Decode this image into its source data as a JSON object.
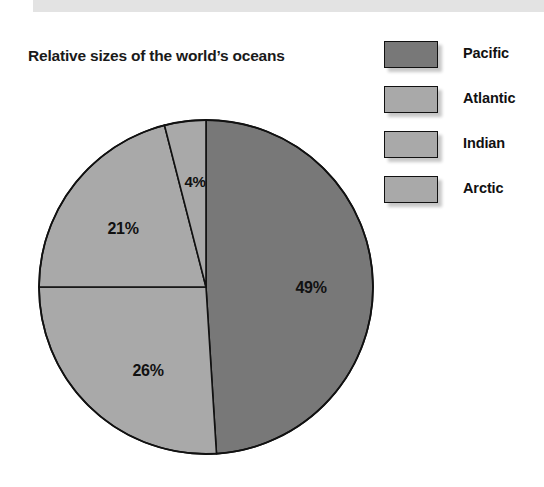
{
  "page": {
    "background_color": "#ffffff",
    "top_band_color": "#e3e3e3"
  },
  "title": "Relative sizes of the world’s oceans",
  "legend": {
    "position": "top-right",
    "items": [
      {
        "label": "Pacific",
        "color": "#787878"
      },
      {
        "label": "Atlantic",
        "color": "#a9a9a9"
      },
      {
        "label": "Indian",
        "color": "#a9a9a9"
      },
      {
        "label": "Arctic",
        "color": "#a9a9a9"
      }
    ]
  },
  "labels": {
    "pacific": "49%",
    "atlantic": "26%",
    "indian": "21%",
    "arctic": "4%"
  },
  "chart_data": {
    "type": "pie",
    "title": "Relative sizes of the world’s oceans",
    "xlabel": "",
    "ylabel": "",
    "unit": "percent",
    "start_angle_deg": 0,
    "direction": "clockwise",
    "grid": false,
    "legend_position": "top-right",
    "categories": [
      "Pacific",
      "Atlantic",
      "Indian",
      "Arctic"
    ],
    "values": [
      49,
      26,
      21,
      4
    ],
    "data_labels": [
      "49%",
      "26%",
      "21%",
      "4%"
    ],
    "colors": [
      "#787878",
      "#a9a9a9",
      "#a9a9a9",
      "#a9a9a9"
    ],
    "slice_outline_color": "#111111",
    "geometry": {
      "center_x": 206,
      "center_y": 287,
      "radius": 167
    }
  }
}
